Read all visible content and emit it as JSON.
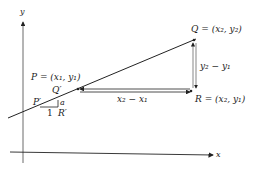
{
  "diagram": {
    "axes": {
      "x_label": "x",
      "y_label": "y"
    },
    "points": {
      "P": "P = (x₁, y₁)",
      "Q": "Q = (x₂, y₂)",
      "R": "R = (x₂, y₁)",
      "P_prime": "P′",
      "Q_prime": "Q′",
      "R_prime": "R′"
    },
    "measurements": {
      "horizontal": "x₂ − x₁",
      "vertical": "y₂ − y₁",
      "small_run": "1",
      "small_rise": "a"
    },
    "colors": {
      "ink": "#222222",
      "background": "#ffffff"
    }
  }
}
